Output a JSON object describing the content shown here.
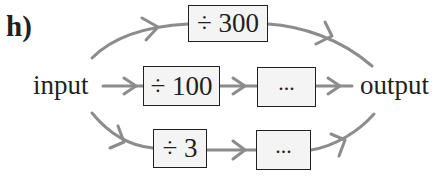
{
  "question_label": "h)",
  "input_label": "input",
  "output_label": "output",
  "colors": {
    "arrow": "#8c8c8c",
    "box_border": "#231f20",
    "box_fill": "#f4f4f4",
    "text": "#231f20"
  },
  "paths": {
    "top": {
      "operations": [
        "÷ 300"
      ]
    },
    "middle": {
      "operations": [
        "÷ 100",
        "..."
      ]
    },
    "bottom": {
      "operations": [
        "÷ 3",
        "..."
      ]
    }
  }
}
